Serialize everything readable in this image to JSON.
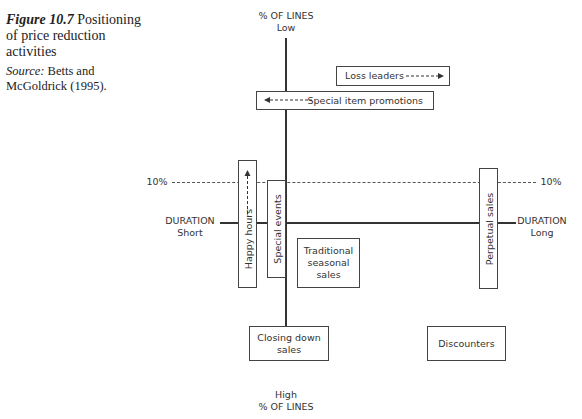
{
  "caption": {
    "figure_label": "Figure 10.7",
    "title": "Positioning of price reduction activities",
    "source_label": "Source:",
    "source_text": "Betts and McGoldrick (1995)."
  },
  "axes": {
    "top_line1": "% OF LINES",
    "top_line2": "Low",
    "bottom_line1": "High",
    "bottom_line2": "% OF LINES",
    "left_line1": "DURATION",
    "left_line2": "Short",
    "right_line1": "DURATION",
    "right_line2": "Long"
  },
  "threshold": {
    "left_label": "10%",
    "right_label": "10%"
  },
  "boxes": {
    "loss_leaders": "Loss leaders",
    "special_item_promotions": "Special item promotions",
    "happy_hours": "Happy hours",
    "special_events": "Special events",
    "traditional_seasonal_sales": "Traditional seasonal sales",
    "perpetual_sales": "Perpetual sales",
    "closing_down_sales": "Closing down sales",
    "discounters": "Discounters"
  }
}
